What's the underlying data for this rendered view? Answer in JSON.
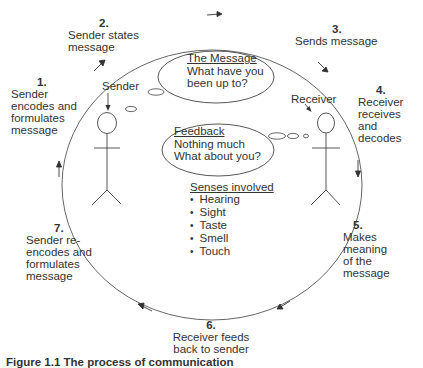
{
  "steps": [
    {
      "number": "1.",
      "lines": [
        "Sender",
        "encodes and",
        "formulates",
        "message"
      ]
    },
    {
      "number": "2.",
      "lines": [
        "Sender states",
        "message"
      ]
    },
    {
      "number": "3.",
      "lines": [
        "Sends message"
      ]
    },
    {
      "number": "4.",
      "lines": [
        "Receiver",
        "receives and",
        "decodes"
      ]
    },
    {
      "number": "5.",
      "lines": [
        "Makes",
        "meaning",
        "of the",
        "message"
      ]
    },
    {
      "number": "6.",
      "lines": [
        "Receiver feeds",
        "back to sender"
      ]
    },
    {
      "number": "7.",
      "lines": [
        "Sender re-",
        "encodes and",
        "formulates",
        "message"
      ]
    }
  ],
  "actors": {
    "sender": "Sender",
    "receiver": "Receiver"
  },
  "message_bubble": {
    "title": "The Message",
    "lines": [
      "What have you",
      "been up to?"
    ]
  },
  "feedback_bubble": {
    "title": "Feedback",
    "lines": [
      "Nothing much",
      "What about you?"
    ]
  },
  "senses": {
    "title": "Senses involved",
    "items": [
      "Hearing",
      "Sight",
      "Taste",
      "Smell",
      "Touch"
    ]
  },
  "caption": "Figure 1.1 The process of communication",
  "colors": {
    "line": "#444444",
    "text": "#333333",
    "background": "#ffffff"
  }
}
